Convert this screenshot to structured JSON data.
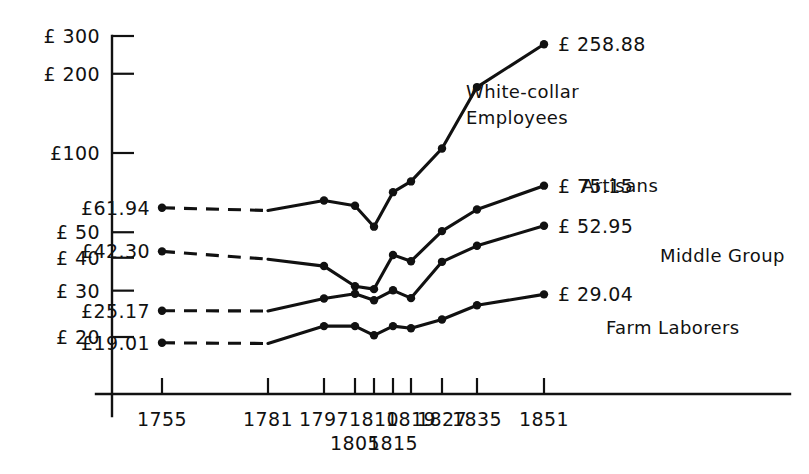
{
  "chart_data": {
    "type": "line",
    "title": "",
    "xlabel": "",
    "ylabel": "",
    "y_scale": "log",
    "y_ticks": [
      {
        "value": 300,
        "label": "£ 300"
      },
      {
        "value": 200,
        "label": "£ 200"
      },
      {
        "value": 100,
        "label": "£100"
      },
      {
        "value": 50,
        "label": "£ 50"
      },
      {
        "value": 40,
        "label": "£ 40"
      },
      {
        "value": 30,
        "label": "£ 30"
      },
      {
        "value": 20,
        "label": "£ 20"
      }
    ],
    "ylim": [
      15,
      340
    ],
    "x_ticks": [
      {
        "value": 1755,
        "label": "1755",
        "row": 0
      },
      {
        "value": 1781,
        "label": "1781",
        "row": 0
      },
      {
        "value": 1797,
        "label": "1797",
        "row": 0
      },
      {
        "value": 1805,
        "label": "1805",
        "row": 1
      },
      {
        "value": 1810,
        "label": "1810",
        "row": 0
      },
      {
        "value": 1815,
        "label": "1815",
        "row": 1
      },
      {
        "value": 1819,
        "label": "1819",
        "row": 0
      },
      {
        "value": 1827,
        "label": "1827",
        "row": 0
      },
      {
        "value": 1835,
        "label": "1835",
        "row": 0
      },
      {
        "value": 1851,
        "label": "1851",
        "row": 0
      }
    ],
    "xlim": [
      1745,
      1862
    ],
    "grid": false,
    "legend": "inline-labels",
    "series": [
      {
        "name": "White-collar Employees",
        "label_text": "White-collar\nEmployees",
        "start_label": "£61.94",
        "end_label": "£ 258.88",
        "start_value": 61.94,
        "end_value": 258.88,
        "dashed_from": 1755,
        "dashed_to": 1781,
        "x": [
          1755,
          1781,
          1797,
          1805,
          1810,
          1815,
          1819,
          1827,
          1835,
          1851
        ],
        "y": [
          61.94,
          60.5,
          66.0,
          63.0,
          52.5,
          71.0,
          78.0,
          104.0,
          178.0,
          258.88
        ]
      },
      {
        "name": "Artisans",
        "label_text": "Artisans",
        "start_label": "£42.30",
        "end_label": "£ 75.15",
        "start_value": 42.3,
        "end_value": 75.15,
        "dashed_from": 1755,
        "dashed_to": 1781,
        "x": [
          1755,
          1781,
          1797,
          1805,
          1810,
          1815,
          1819,
          1827,
          1835,
          1851
        ],
        "y": [
          42.3,
          39.5,
          37.2,
          31.2,
          30.4,
          41.0,
          38.8,
          50.5,
          61.0,
          75.15
        ]
      },
      {
        "name": "Middle Group",
        "label_text": "Middle Group",
        "start_label": "£25.17",
        "end_label": "£ 52.95",
        "start_value": 25.17,
        "end_value": 52.95,
        "dashed_from": 1755,
        "dashed_to": 1781,
        "x": [
          1755,
          1781,
          1797,
          1805,
          1810,
          1815,
          1819,
          1827,
          1835,
          1851
        ],
        "y": [
          25.17,
          25.1,
          28.0,
          29.2,
          27.6,
          30.1,
          28.1,
          38.6,
          44.4,
          52.95
        ]
      },
      {
        "name": "Farm Laborers",
        "label_text": "Farm Laborers",
        "start_label": "£19.01",
        "end_label": "£ 29.04",
        "start_value": 19.01,
        "end_value": 29.04,
        "dashed_from": 1755,
        "dashed_to": 1781,
        "x": [
          1755,
          1781,
          1797,
          1805,
          1810,
          1815,
          1819,
          1827,
          1835,
          1851
        ],
        "y": [
          19.01,
          18.9,
          22.0,
          22.0,
          20.3,
          22.0,
          21.6,
          23.3,
          26.4,
          29.04
        ]
      }
    ]
  },
  "style": {
    "ink": "#111111",
    "background": "#ffffff"
  }
}
